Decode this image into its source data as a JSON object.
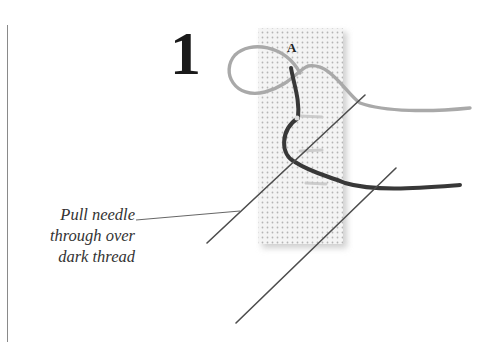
{
  "step": {
    "number": "1"
  },
  "point_label": "A",
  "caption": {
    "lines": [
      "Pull needle",
      "through over",
      "dark thread"
    ]
  },
  "colors": {
    "fabric": "#f2f2f2",
    "fabric_dots": "#b8b8b8",
    "light_thread": "#a8a8a8",
    "dark_thread": "#3a3a3a",
    "needle": "#555555",
    "text": "#333333"
  }
}
